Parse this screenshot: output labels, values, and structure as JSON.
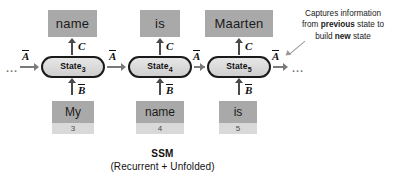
{
  "diagram": {
    "columns": [
      {
        "output": "name",
        "state_label": "State",
        "state_index": "3",
        "input": "My",
        "input_index": "3",
        "up_label": "C",
        "down_label": "B",
        "recurrent_label": "A"
      },
      {
        "output": "is",
        "state_label": "State",
        "state_index": "4",
        "input": "name",
        "input_index": "4",
        "up_label": "C",
        "down_label": "B",
        "recurrent_label": "A"
      },
      {
        "output": "Maarten",
        "state_label": "State",
        "state_index": "5",
        "input": "is",
        "input_index": "5",
        "up_label": "C",
        "down_label": "B",
        "recurrent_label": "A"
      }
    ],
    "left_ellipsis": "...",
    "left_recurrent_label": "A",
    "right_ellipsis": "...",
    "annotation": {
      "line1_a": "Captures information",
      "line2_a": "from ",
      "line2_b": "previous",
      "line2_c": " state to",
      "line3_a": "build ",
      "line3_b": "new",
      "line3_c": " state"
    },
    "caption": {
      "title": "SSM",
      "subtitle": "(Recurrent + Unfolded)"
    },
    "colors": {
      "word_box": "#a9a9a9",
      "index_box": "#d9d9d9",
      "state_fill": "#d8d8d8",
      "state_stroke": "#1a1a1a",
      "arrow": "#4a4a4a",
      "recurrent_arrow": "#7a7a7a"
    }
  }
}
